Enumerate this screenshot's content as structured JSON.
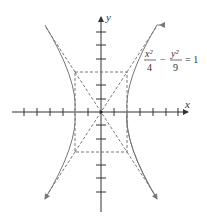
{
  "diagram": {
    "type": "hyperbola",
    "equation": {
      "x_num": "x²",
      "x_den": "4",
      "minus": "−",
      "y_num": "y²",
      "y_den": "9",
      "rhs": "= 1"
    },
    "axes": {
      "x_label": "x",
      "y_label": "y"
    },
    "a": 2,
    "b": 3,
    "asymptotes": [
      "y = 3x/2",
      "y = -3x/2"
    ],
    "colors": {
      "curve": "#777777",
      "axis": "#333333",
      "dashed": "#555555"
    }
  }
}
